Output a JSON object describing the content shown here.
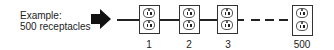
{
  "caption": {
    "line1": "Example:",
    "line2": "500 receptacles"
  },
  "icons": {
    "arrow": "right-arrow-icon",
    "receptacle": "duplex-receptacle-icon"
  },
  "receptacles": [
    {
      "label": "1"
    },
    {
      "label": "2"
    },
    {
      "label": "3"
    },
    {
      "label": "500"
    }
  ],
  "colors": {
    "line": "#222222",
    "background": "#ffffff"
  }
}
